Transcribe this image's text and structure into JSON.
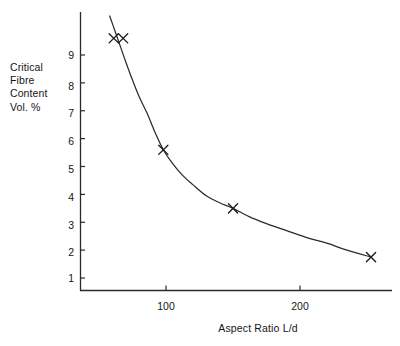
{
  "chart_data": {
    "type": "line",
    "title": "",
    "subtitle": "",
    "xlabel": "Aspect Ratio L/d",
    "ylabel": "Critical Fibre Content Vol. %",
    "ylabel_lines": [
      "Critical",
      "Fibre",
      "Content",
      "Vol. %"
    ],
    "xlim": [
      36,
      300
    ],
    "ylim": [
      0.55,
      10.4
    ],
    "xticks": [
      100,
      200
    ],
    "xtick_labels": [
      "100",
      "200"
    ],
    "yticks": [
      1,
      2,
      3,
      4,
      5,
      6,
      7,
      8,
      9
    ],
    "ytick_labels": [
      "1",
      "2",
      "3",
      "4",
      "5",
      "6",
      "7",
      "8",
      "9"
    ],
    "grid": false,
    "legend": null,
    "marker": "x-cross",
    "series": [
      {
        "name": "Critical fibre content",
        "x": [
          61,
          68,
          98,
          150,
          253
        ],
        "values": [
          9.6,
          9.6,
          5.6,
          3.5,
          1.75
        ]
      }
    ],
    "fit_curve": {
      "description": "smooth hyperbolic decay through data points",
      "x": [
        58,
        62,
        66,
        70,
        75,
        80,
        86,
        92,
        98,
        105,
        112,
        120,
        130,
        140,
        150,
        162,
        175,
        190,
        205,
        220,
        235,
        253
      ],
      "y": [
        10.4,
        9.85,
        9.3,
        8.75,
        8.1,
        7.5,
        6.9,
        6.2,
        5.6,
        5.1,
        4.7,
        4.35,
        3.95,
        3.7,
        3.5,
        3.2,
        2.95,
        2.7,
        2.45,
        2.25,
        2.0,
        1.75
      ]
    },
    "annotations": [],
    "axes_color": "#2a2a2a",
    "curve_color": "#2b2b2b",
    "marker_color": "#1c1c1c"
  },
  "figure": {
    "background_color": "#ffffff"
  }
}
